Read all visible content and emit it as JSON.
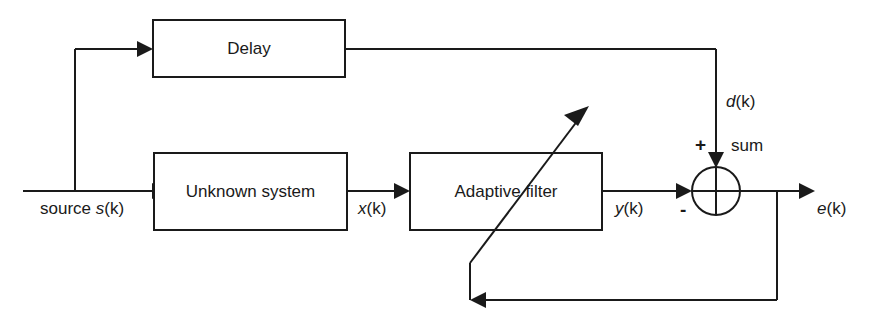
{
  "diagram": {
    "type": "block-diagram",
    "background_color": "#ffffff",
    "line_color": "#1a1a1a",
    "blocks": [
      {
        "id": "delay",
        "label": "Delay"
      },
      {
        "id": "unknown-system",
        "label": "Unknown system"
      },
      {
        "id": "adaptive-filter",
        "label": "Adaptive filter"
      }
    ],
    "nodes": [
      {
        "id": "summing-junction",
        "label": "sum",
        "plus_sign": "+",
        "minus_sign": "-"
      }
    ],
    "signals": [
      {
        "id": "source",
        "text_plain": "source ",
        "text_italic": "s",
        "text_tail": "(k)"
      },
      {
        "id": "x-signal",
        "text_italic": "x",
        "text_tail": "(k)"
      },
      {
        "id": "y-signal",
        "text_italic": "y",
        "text_tail": "(k)"
      },
      {
        "id": "d-signal",
        "text_italic": "d",
        "text_tail": "(k)"
      },
      {
        "id": "e-signal",
        "text_italic": "e",
        "text_tail": "(k)"
      }
    ],
    "labels": {
      "delay": "Delay",
      "unknown_system": "Unknown system",
      "adaptive_filter": "Adaptive filter",
      "sum": "sum",
      "plus": "+",
      "minus": "-",
      "source_prefix": "source ",
      "source_var": "s",
      "source_arg": "(k)",
      "x_var": "x",
      "x_arg": "(k)",
      "y_var": "y",
      "y_arg": "(k)",
      "d_var": "d",
      "d_arg": "(k)",
      "e_var": "e",
      "e_arg": "(k)"
    }
  }
}
